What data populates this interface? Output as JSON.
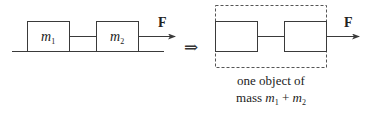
{
  "left_system": {
    "block1_label": "m",
    "block1_sub": "1",
    "block2_label": "m",
    "block2_sub": "2",
    "force_label": "F"
  },
  "implies_symbol": "⇒",
  "right_system": {
    "force_label": "F",
    "caption_line1": "one object of",
    "caption_line2_prefix": "mass ",
    "caption_m1": "m",
    "caption_m1_sub": "1",
    "caption_plus": " + ",
    "caption_m2": "m",
    "caption_m2_sub": "2"
  },
  "colors": {
    "stroke": "#3a3a3a",
    "text": "#222222",
    "dashed": "#555555"
  }
}
